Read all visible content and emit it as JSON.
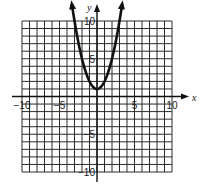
{
  "chart_data": {
    "type": "line",
    "title": "",
    "xlabel": "x",
    "ylabel": "y",
    "xlim": [
      -10,
      10
    ],
    "ylim": [
      -10,
      10
    ],
    "grid": true,
    "grid_step": 1,
    "x_ticks": [
      {
        "value": -10,
        "label": "−10"
      },
      {
        "value": -5,
        "label": "−5"
      },
      {
        "value": 5,
        "label": "5"
      },
      {
        "value": 10,
        "label": "10"
      }
    ],
    "y_ticks": [
      {
        "value": 10,
        "label": "10"
      },
      {
        "value": 5,
        "label": "5"
      },
      {
        "value": -5,
        "label": "−5"
      },
      {
        "value": -10,
        "label": "−10"
      }
    ],
    "series": [
      {
        "name": "parabola",
        "equation": "y = x^2 + 1",
        "vertex": [
          0,
          1
        ],
        "x": [
          -3.3,
          -3,
          -2,
          -1,
          0,
          1,
          2,
          3,
          3.3
        ],
        "values": [
          11.89,
          10,
          5,
          2,
          1,
          2,
          5,
          10,
          11.89
        ],
        "arrows_at_ends": true
      }
    ],
    "legend": null
  },
  "labels": {
    "x_axis": "x",
    "y_axis": "y"
  }
}
